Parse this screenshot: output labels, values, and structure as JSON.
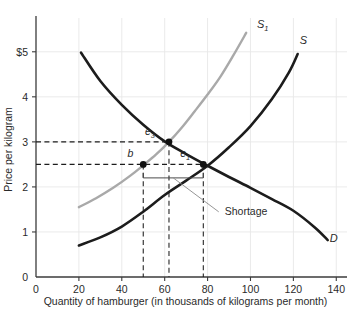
{
  "figure": {
    "name": "supply-demand-shortage-diagram"
  },
  "chart_data": {
    "type": "line",
    "title": "",
    "xlabel": "Quantity  of hamburger (in thousands of kilograms per month)",
    "ylabel": "Price per kilogram",
    "xlim": [
      0,
      145
    ],
    "ylim": [
      0,
      5.75
    ],
    "grid": true,
    "legend_position": "inline-curve-labels",
    "xticks": [
      0,
      20,
      40,
      60,
      80,
      100,
      120,
      140
    ],
    "xtick_labels": [
      "0",
      "20",
      "40",
      "60",
      "80",
      "100",
      "120",
      "140"
    ],
    "yticks": [
      0,
      1,
      2,
      3,
      4,
      5
    ],
    "ytick_labels": [
      "0",
      "1",
      "2",
      "3",
      "4",
      "$5"
    ],
    "series": [
      {
        "name": "D",
        "label": "D",
        "role": "demand",
        "color": "#1c1c1c",
        "label_x": 137,
        "label_y": 0.78,
        "x": [
          21,
          30,
          40,
          50,
          60,
          70,
          80,
          90,
          100,
          110,
          120,
          130,
          136
        ],
        "y": [
          4.98,
          4.35,
          3.82,
          3.38,
          3.01,
          2.73,
          2.47,
          2.22,
          1.98,
          1.73,
          1.47,
          1.1,
          0.82
        ]
      },
      {
        "name": "S",
        "label": "S",
        "role": "supply-original",
        "color": "#1c1c1c",
        "label_x": 123,
        "label_y": 5.18,
        "x": [
          20,
          30,
          40,
          50,
          60,
          70,
          80,
          90,
          100,
          110,
          118,
          122
        ],
        "y": [
          0.7,
          0.88,
          1.12,
          1.45,
          1.82,
          2.14,
          2.47,
          2.88,
          3.35,
          3.95,
          4.55,
          4.95
        ]
      },
      {
        "name": "S_1",
        "label": "S",
        "label_sub": "1",
        "role": "supply-shifted",
        "color": "#a9a9a9",
        "label_x": 103,
        "label_y": 5.52,
        "x": [
          20,
          28,
          36,
          44,
          50,
          56,
          62,
          68,
          74,
          80,
          86,
          92,
          98
        ],
        "y": [
          1.55,
          1.75,
          1.98,
          2.25,
          2.48,
          2.72,
          3.0,
          3.32,
          3.68,
          4.05,
          4.45,
          4.92,
          5.42
        ]
      }
    ],
    "points": [
      {
        "name": "e_1",
        "label": "e",
        "label_sub": "1",
        "x": 78,
        "y": 2.5,
        "marker": "filled-circle",
        "label_dx": -13,
        "label_dy": -7
      },
      {
        "name": "e_3",
        "label": "e",
        "label_sub": "3",
        "x": 62,
        "y": 3.0,
        "marker": "filled-circle",
        "label_dx": -14,
        "label_dy": -7
      },
      {
        "name": "b",
        "label": "b",
        "x": 50,
        "y": 2.5,
        "marker": "filled-circle",
        "label_dx": -10,
        "label_dy": -7
      }
    ],
    "guides": {
      "horizontal_dashed": [
        {
          "y": 3.0,
          "x_from": 0,
          "x_to": 62
        },
        {
          "y": 2.5,
          "x_from": 0,
          "x_to": 78
        }
      ],
      "vertical_dashed": [
        {
          "x": 50,
          "y_from": 0,
          "y_to": 2.5
        },
        {
          "x": 62,
          "y_from": 0,
          "y_to": 3.0
        },
        {
          "x": 78,
          "y_from": 0,
          "y_to": 2.5
        }
      ]
    },
    "annotations": [
      {
        "name": "shortage",
        "text": "Shortage",
        "bracket_y": 2.2,
        "bracket_x_from": 50,
        "bracket_x_to": 78,
        "text_x": 88,
        "text_y": 1.38
      }
    ]
  }
}
